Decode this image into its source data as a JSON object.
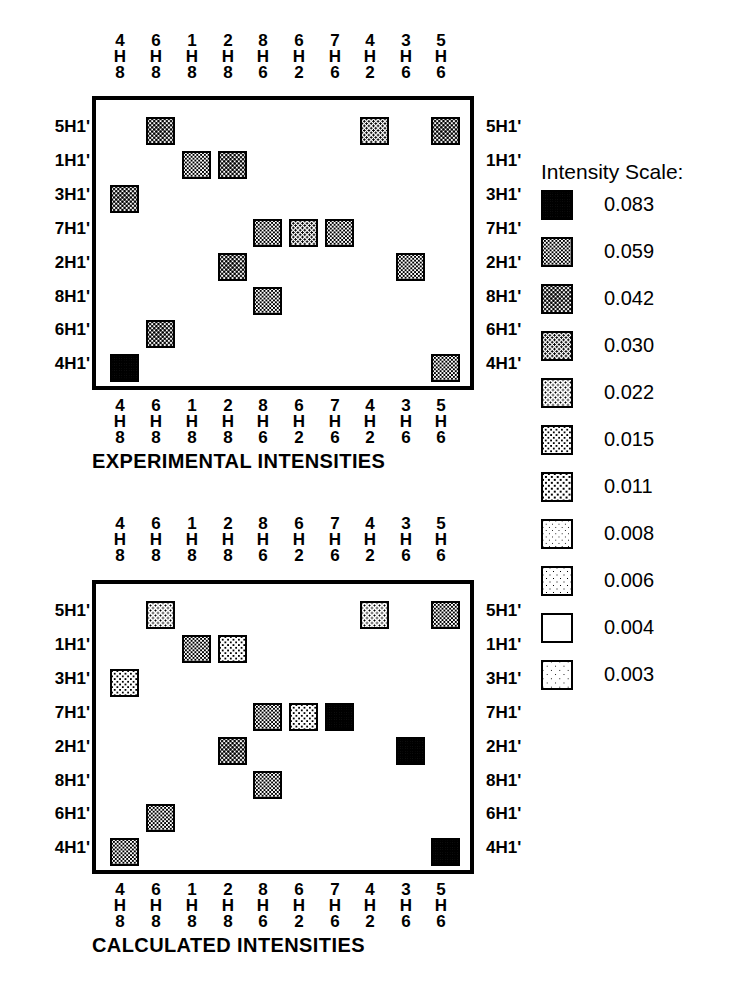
{
  "figure": {
    "column_labels": [
      "4H8",
      "6H8",
      "1H8",
      "2H8",
      "8H6",
      "6H2",
      "7H6",
      "4H2",
      "3H6",
      "5H6"
    ],
    "row_labels": [
      "5H1'",
      "1H1'",
      "3H1'",
      "7H1'",
      "2H1'",
      "8H1'",
      "6H1'",
      "4H1'"
    ]
  },
  "legend": {
    "title": "Intensity Scale:",
    "values": [
      "0.083",
      "0.059",
      "0.042",
      "0.030",
      "0.022",
      "0.015",
      "0.011",
      "0.008",
      "0.006",
      "0.004",
      "0.003"
    ],
    "numeric_values": [
      0.083,
      0.059,
      0.042,
      0.03,
      0.022,
      0.015,
      0.011,
      0.008,
      0.006,
      0.004,
      0.003
    ]
  },
  "panels": [
    {
      "id": "experimental",
      "caption": "EXPERIMENTAL INTENSITIES",
      "column_labels": [
        "4H8",
        "6H8",
        "1H8",
        "2H8",
        "8H6",
        "6H2",
        "7H6",
        "4H2",
        "3H6",
        "5H6"
      ],
      "row_labels": [
        "5H1'",
        "1H1'",
        "3H1'",
        "7H1'",
        "2H1'",
        "8H1'",
        "6H1'",
        "4H1'"
      ]
    },
    {
      "id": "calculated",
      "caption": "CALCULATED INTENSITIES",
      "column_labels": [
        "4H8",
        "6H8",
        "1H8",
        "2H8",
        "8H6",
        "6H2",
        "7H6",
        "4H2",
        "3H6",
        "5H6"
      ],
      "row_labels": [
        "5H1'",
        "1H1'",
        "3H1'",
        "7H1'",
        "2H1'",
        "8H1'",
        "6H1'",
        "4H1'"
      ]
    }
  ],
  "chart_data": {
    "type": "heatmap",
    "xlabel": "",
    "ylabel": "",
    "grid": false,
    "legend_position": "right",
    "x_categories": [
      "4H8",
      "6H8",
      "1H8",
      "2H8",
      "8H6",
      "6H2",
      "7H6",
      "4H2",
      "3H6",
      "5H6"
    ],
    "y_categories": [
      "5H1'",
      "1H1'",
      "3H1'",
      "7H1'",
      "2H1'",
      "8H1'",
      "6H1'",
      "4H1'"
    ],
    "scale_levels": [
      0.083,
      0.059,
      0.042,
      0.03,
      0.022,
      0.015,
      0.011,
      0.008,
      0.006,
      0.004,
      0.003
    ],
    "series": [
      {
        "name": "EXPERIMENTAL INTENSITIES",
        "cells": [
          {
            "row": "5H1'",
            "col": "6H8",
            "level": 2,
            "value": 0.042
          },
          {
            "row": "5H1'",
            "col": "4H2",
            "level": 3,
            "value": 0.03
          },
          {
            "row": "5H1'",
            "col": "5H6",
            "level": 2,
            "value": 0.042
          },
          {
            "row": "1H1'",
            "col": "1H8",
            "level": 1,
            "value": 0.059
          },
          {
            "row": "1H1'",
            "col": "2H8",
            "level": 2,
            "value": 0.042
          },
          {
            "row": "3H1'",
            "col": "4H8",
            "level": 2,
            "value": 0.042
          },
          {
            "row": "7H1'",
            "col": "8H6",
            "level": 1,
            "value": 0.059
          },
          {
            "row": "7H1'",
            "col": "6H2",
            "level": 3,
            "value": 0.03
          },
          {
            "row": "7H1'",
            "col": "7H6",
            "level": 1,
            "value": 0.059
          },
          {
            "row": "2H1'",
            "col": "2H8",
            "level": 2,
            "value": 0.042
          },
          {
            "row": "2H1'",
            "col": "3H6",
            "level": 1,
            "value": 0.059
          },
          {
            "row": "8H1'",
            "col": "8H6",
            "level": 1,
            "value": 0.059
          },
          {
            "row": "6H1'",
            "col": "6H8",
            "level": 2,
            "value": 0.042
          },
          {
            "row": "4H1'",
            "col": "4H8",
            "level": 0,
            "value": 0.083
          },
          {
            "row": "4H1'",
            "col": "5H6",
            "level": 1,
            "value": 0.059
          }
        ]
      },
      {
        "name": "CALCULATED INTENSITIES",
        "cells": [
          {
            "row": "5H1'",
            "col": "6H8",
            "level": 4,
            "value": 0.022
          },
          {
            "row": "5H1'",
            "col": "4H2",
            "level": 4,
            "value": 0.022
          },
          {
            "row": "5H1'",
            "col": "5H6",
            "level": 1,
            "value": 0.059
          },
          {
            "row": "1H1'",
            "col": "1H8",
            "level": 1,
            "value": 0.059
          },
          {
            "row": "1H1'",
            "col": "2H8",
            "level": 5,
            "value": 0.015
          },
          {
            "row": "3H1'",
            "col": "4H8",
            "level": 5,
            "value": 0.015
          },
          {
            "row": "7H1'",
            "col": "8H6",
            "level": 1,
            "value": 0.059
          },
          {
            "row": "7H1'",
            "col": "6H2",
            "level": 5,
            "value": 0.015
          },
          {
            "row": "7H1'",
            "col": "7H6",
            "level": 0,
            "value": 0.083
          },
          {
            "row": "2H1'",
            "col": "2H8",
            "level": 2,
            "value": 0.042
          },
          {
            "row": "2H1'",
            "col": "3H6",
            "level": 0,
            "value": 0.083
          },
          {
            "row": "8H1'",
            "col": "8H6",
            "level": 1,
            "value": 0.059
          },
          {
            "row": "6H1'",
            "col": "6H8",
            "level": 1,
            "value": 0.059
          },
          {
            "row": "4H1'",
            "col": "4H8",
            "level": 1,
            "value": 0.059
          },
          {
            "row": "4H1'",
            "col": "5H6",
            "level": 0,
            "value": 0.083
          }
        ]
      }
    ]
  },
  "geometry": {
    "col_centers": [
      120,
      156,
      192,
      228,
      263,
      299,
      335,
      370,
      406,
      441
    ],
    "panel_left": 92,
    "panel_width": 382,
    "panels": [
      {
        "id": "experimental",
        "header_top": 33,
        "box_top": 96,
        "box_height": 294,
        "row_centers": [
          127,
          161,
          195,
          229,
          263,
          297,
          330,
          364
        ],
        "footer_top": 398,
        "caption_top": 450
      },
      {
        "id": "calculated",
        "header_top": 516,
        "box_top": 580,
        "box_height": 294,
        "row_centers": [
          611,
          645,
          679,
          713,
          747,
          781,
          814,
          848
        ],
        "footer_top": 882,
        "caption_top": 934
      }
    ],
    "legend_rows_top": [
      190,
      237,
      284,
      331,
      378,
      425,
      472,
      519,
      566,
      613,
      660
    ]
  }
}
